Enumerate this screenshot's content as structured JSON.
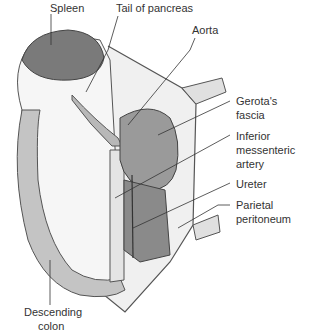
{
  "diagram": {
    "type": "anatomical-illustration",
    "colors": {
      "organ_dark": "#7a7a7a",
      "organ_mid": "#a8a8a8",
      "organ_light": "#dcdcdc",
      "tissue": "#f2f2f2",
      "line": "#444444",
      "label": "#333333"
    },
    "labels": {
      "spleen": "Spleen",
      "tail_of_pancreas": "Tail of pancreas",
      "aorta": "Aorta",
      "gerotas_fascia_1": "Gerota's",
      "gerotas_fascia_2": "fascia",
      "ima_1": "Inferior",
      "ima_2": "messenteric",
      "ima_3": "artery",
      "ureter": "Ureter",
      "parietal_1": "Parietal",
      "parietal_2": "peritoneum",
      "colon_1": "Descending",
      "colon_2": "colon"
    }
  }
}
